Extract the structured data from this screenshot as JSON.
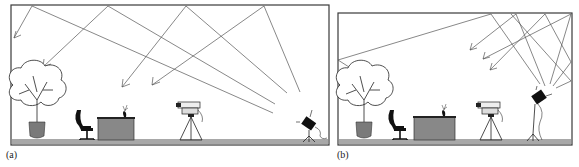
{
  "figure": {
    "panels": [
      {
        "id": "a",
        "caption": "(a)",
        "description": "Light fixture aimed upward at ceiling; light bounces between ceiling and walls onto the room",
        "objects": [
          "plant",
          "office-chair",
          "desk",
          "desk-plant",
          "video-camera-on-tripod",
          "spotlight-on-stand"
        ]
      },
      {
        "id": "b",
        "caption": "(b)",
        "description": "Light fixture aimed into the upper corner; light bounces off ceiling and side wall back into the room",
        "objects": [
          "plant",
          "office-chair",
          "desk",
          "desk-plant",
          "video-camera-on-tripod",
          "spotlight-on-stand"
        ]
      }
    ],
    "colors": {
      "outline": "#3a3a3a",
      "ray": "#555555",
      "floor": "#a8a8a8",
      "desk": "#888888",
      "pot": "#7a7a7a",
      "dark": "#111111"
    }
  }
}
